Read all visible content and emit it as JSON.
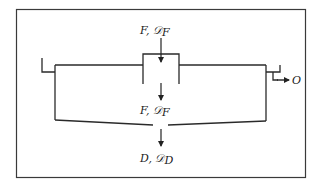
{
  "diagram": {
    "type": "thickener-settling-tank-schematic",
    "frame": {
      "stroke": "#3a3a3a"
    },
    "line_color": "#2a2a2a",
    "labels": {
      "feed_top": {
        "main": "F, ",
        "script": "𝒟",
        "sub": "F"
      },
      "feed_mid": {
        "main": "F, ",
        "script": "𝒟",
        "sub": "F"
      },
      "underflow": {
        "main": "D, ",
        "script": "𝒟",
        "sub": "D"
      },
      "overflow": {
        "main": "O"
      }
    },
    "arrows": [
      {
        "name": "feed-in-arrow",
        "direction": "down"
      },
      {
        "name": "feed-well-out-arrow",
        "direction": "down"
      },
      {
        "name": "underflow-arrow",
        "direction": "down"
      },
      {
        "name": "overflow-arrow",
        "direction": "right"
      }
    ]
  }
}
